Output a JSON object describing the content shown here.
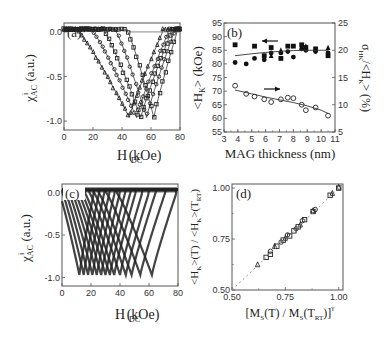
{
  "figure": {
    "panels": [
      "(a)",
      "(b)",
      "(c)",
      "(d)"
    ]
  },
  "chart_data": [
    {
      "panel": "(a)",
      "type": "line",
      "xlabel": "H_DC (kOe)",
      "ylabel": "χ^i_AC (a.u.)",
      "xlim": [
        0,
        80
      ],
      "ylim": [
        -1.1,
        0.1
      ],
      "xticks": [
        "0",
        "20",
        "40",
        "60",
        "80"
      ],
      "yticks": [
        "0.0",
        "-0.5",
        "-1.0"
      ],
      "series": [
        {
          "name": "curve1",
          "onset": 10,
          "min_x": 45,
          "return": 68
        },
        {
          "name": "curve2",
          "onset": 20,
          "min_x": 50,
          "return": 72
        },
        {
          "name": "curve3",
          "onset": 28,
          "min_x": 53,
          "return": 74
        },
        {
          "name": "curve4",
          "onset": 36,
          "min_x": 57,
          "return": 76
        },
        {
          "name": "curve5",
          "onset": 44,
          "min_x": 62,
          "return": 78
        }
      ],
      "reference_line_y": 0.0
    },
    {
      "panel": "(b)",
      "type": "scatter",
      "xlabel": "MAG thickness (nm)",
      "ylabel_left": "<H_K> (kOe)",
      "ylabel_right": "σ_HK/<H_K> (%)",
      "xlim": [
        3,
        11
      ],
      "ylim_left": [
        55,
        95
      ],
      "ylim_right": [
        5,
        25
      ],
      "xticks": [
        "3",
        "4",
        "5",
        "6",
        "7",
        "8",
        "9",
        "10",
        "11"
      ],
      "yticks_left": [
        "55",
        "60",
        "65",
        "70",
        "75",
        "80",
        "85",
        "90",
        "95"
      ],
      "yticks_right": [
        "5",
        "10",
        "15",
        "20",
        "25"
      ],
      "series": [
        {
          "name": "<H_K> squares",
          "axis": "left",
          "marker": "filled-square",
          "x": [
            3.8,
            5.2,
            5.9,
            6.4,
            7.1,
            7.6,
            8.0,
            8.6,
            8.9,
            9.6,
            10.5
          ],
          "y": [
            87,
            86.5,
            83,
            86,
            82,
            86.5,
            86.5,
            87,
            86,
            85.5,
            83
          ]
        },
        {
          "name": "<H_K> circles",
          "axis": "left",
          "marker": "filled-circle",
          "x": [
            3.8,
            4.6,
            5.2,
            5.9,
            6.4,
            7.1,
            7.6,
            8.0,
            8.6,
            8.9,
            9.6,
            10.5
          ],
          "y": [
            80.5,
            80,
            82,
            81.5,
            84,
            84,
            84.5,
            82.5,
            85.5,
            85,
            84.5,
            84
          ]
        },
        {
          "name": "<H_K> triangles",
          "axis": "left",
          "marker": "filled-triangle",
          "x": [
            6.4,
            7.1,
            8.6,
            8.9,
            10.5
          ],
          "y": [
            83,
            85,
            86,
            86.5,
            86
          ]
        },
        {
          "name": "<H_K> fit",
          "axis": "left",
          "marker": "line",
          "x": [
            3.8,
            5,
            6,
            7,
            8,
            9,
            10,
            10.5
          ],
          "y": [
            83,
            83.7,
            84.2,
            84.6,
            84.9,
            85,
            85,
            85
          ]
        },
        {
          "name": "σ_HK/<H_K>",
          "axis": "right",
          "marker": "open-circle",
          "x": [
            3.8,
            4.6,
            5.2,
            5.9,
            6.4,
            7.1,
            7.6,
            8.0,
            8.6,
            8.9,
            9.6,
            10.5
          ],
          "y": [
            13.5,
            12,
            11.5,
            11,
            10.5,
            11,
            11.3,
            11.2,
            10,
            9,
            9.5,
            8
          ]
        },
        {
          "name": "σ fit",
          "axis": "right",
          "marker": "line",
          "x": [
            3.8,
            5,
            6,
            7,
            8,
            9,
            10,
            10.5
          ],
          "y": [
            12.7,
            12,
            11.4,
            10.9,
            10.4,
            9.8,
            9.0,
            8.4
          ]
        }
      ],
      "annotations": [
        "arrow-left (points to left axis, upper data)",
        "arrow-right (points to right axis, lower data)"
      ]
    },
    {
      "panel": "(c)",
      "type": "line",
      "xlabel": "H_DC (kOe)",
      "ylabel": "χ^i_AC (a.u.)",
      "xlim": [
        0,
        80
      ],
      "ylim": [
        -1.1,
        0.1
      ],
      "xticks": [
        "0",
        "20",
        "40",
        "60",
        "80"
      ],
      "yticks": [
        "0.0",
        "-0.5",
        "-1.0"
      ],
      "series_count": 14,
      "min_positions_kOe": [
        12,
        15,
        18,
        21,
        24,
        27,
        30,
        33,
        36,
        40,
        44,
        48,
        54,
        62
      ]
    },
    {
      "panel": "(d)",
      "type": "scatter",
      "xlabel": "[M_S(T) / M_S(T_RT)]^γ",
      "ylabel": "<H_K>(T) / <H_K>(T_RT)",
      "xlim": [
        0.5,
        1.02
      ],
      "ylim": [
        0.5,
        1.02
      ],
      "xticks": [
        "0.50",
        "0.75",
        "1.00"
      ],
      "yticks": [
        "0.50",
        "0.75",
        "1.00"
      ],
      "series": [
        {
          "name": "squares",
          "marker": "open-square",
          "x": [
            0.66,
            0.68,
            0.71,
            0.74,
            0.77,
            0.79,
            0.81,
            0.84,
            0.88,
            0.96,
            1.0
          ],
          "y": [
            0.66,
            0.675,
            0.715,
            0.745,
            0.765,
            0.79,
            0.81,
            0.845,
            0.885,
            0.965,
            1.0
          ]
        },
        {
          "name": "circles",
          "marker": "open-circle",
          "x": [
            0.68,
            0.73,
            0.76,
            0.8,
            0.83,
            0.89
          ],
          "y": [
            0.69,
            0.735,
            0.77,
            0.8,
            0.84,
            0.895
          ]
        },
        {
          "name": "triangles",
          "marker": "open-triangle",
          "x": [
            0.62,
            0.7,
            0.75,
            0.82,
            0.88,
            0.97,
            1.0
          ],
          "y": [
            0.625,
            0.715,
            0.755,
            0.82,
            0.89,
            0.975,
            1.005
          ]
        },
        {
          "name": "y=x guide",
          "marker": "dashed-line",
          "x": [
            0.5,
            1.02
          ],
          "y": [
            0.5,
            1.02
          ]
        }
      ]
    }
  ]
}
